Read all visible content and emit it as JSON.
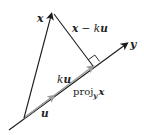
{
  "diagram": {
    "labels": {
      "x": "x",
      "x_minus_ku_x": "x",
      "x_minus_ku_op": " − ",
      "x_minus_ku_k": "k",
      "x_minus_ku_u": "u",
      "ku_k": "k",
      "ku_u": "u",
      "proj_text": "proj",
      "proj_sub": "y",
      "proj_arg": "x",
      "u": "u",
      "y": "y"
    },
    "colors": {
      "vector_black": "#1a1a1a",
      "projection_gray": "#9a9a9a",
      "background": "#ffffff"
    },
    "points": {
      "origin": [
        24,
        118
      ],
      "x_tip": [
        52,
        12
      ],
      "foot": [
        93,
        66
      ],
      "y_tip": [
        128,
        43
      ],
      "line_start": [
        9,
        130
      ]
    }
  }
}
